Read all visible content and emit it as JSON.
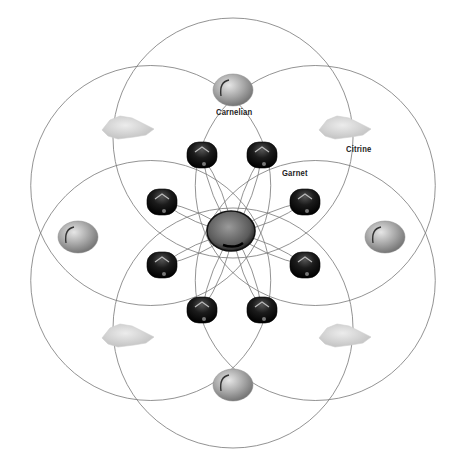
{
  "diagram": {
    "type": "crystal-grid",
    "center": {
      "x": 233,
      "y": 233
    },
    "circles": {
      "radius": 120,
      "offset": 95,
      "count": 6,
      "stroke": "#777777"
    },
    "center_stone": {
      "name": "center-stone",
      "x": 231,
      "y": 231,
      "rx": 24,
      "ry": 20
    },
    "stones": {
      "carnelian": [
        {
          "x": 233,
          "y": 90
        },
        {
          "x": 385,
          "y": 237
        },
        {
          "x": 233,
          "y": 385
        },
        {
          "x": 78,
          "y": 237
        }
      ],
      "citrine": [
        {
          "x": 128,
          "y": 128
        },
        {
          "x": 345,
          "y": 128
        },
        {
          "x": 128,
          "y": 336
        },
        {
          "x": 345,
          "y": 336
        }
      ],
      "garnet": [
        {
          "x": 202,
          "y": 155
        },
        {
          "x": 262,
          "y": 155
        },
        {
          "x": 162,
          "y": 202
        },
        {
          "x": 305,
          "y": 202
        },
        {
          "x": 162,
          "y": 265
        },
        {
          "x": 305,
          "y": 265
        },
        {
          "x": 202,
          "y": 310
        },
        {
          "x": 262,
          "y": 310
        }
      ]
    },
    "labels": {
      "carnelian": "Carnelian",
      "citrine": "Citrine",
      "garnet": "Garnet"
    },
    "colors": {
      "carnelian": "#9a9a9a",
      "citrine": "#d2d2d2",
      "garnet": "#1a1a1a",
      "center": "#555555",
      "lines": "#777777"
    }
  }
}
